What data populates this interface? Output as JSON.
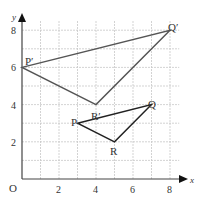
{
  "diagram": {
    "type": "coordinate-grid-enlargement",
    "axes": {
      "x_label": "x",
      "y_label": "y",
      "origin_label": "O",
      "x_ticks": [
        "2",
        "4",
        "6",
        "8"
      ],
      "y_ticks": [
        "2",
        "4",
        "6",
        "8"
      ],
      "x_range": [
        0,
        9
      ],
      "y_range": [
        0,
        9
      ]
    },
    "shapes": [
      {
        "name": "image-triangle",
        "vertices": [
          {
            "label": "P′",
            "x": 0,
            "y": 6
          },
          {
            "label": "Q′",
            "x": 8,
            "y": 8
          },
          {
            "label": "R′",
            "x": 4,
            "y": 4
          }
        ],
        "color": "#555555"
      },
      {
        "name": "object-triangle",
        "vertices": [
          {
            "label": "P",
            "x": 3,
            "y": 3
          },
          {
            "label": "Q",
            "x": 7,
            "y": 4
          },
          {
            "label": "R",
            "x": 5,
            "y": 2
          }
        ],
        "color": "#222222"
      }
    ],
    "grid_color": "#bbbbbb",
    "axis_color": "#444444"
  }
}
